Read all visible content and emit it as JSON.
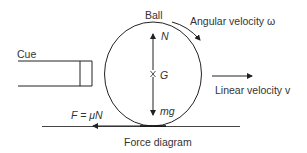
{
  "diagram": {
    "labels": {
      "cue": "Cue",
      "ball": "Ball",
      "angular_velocity": "Angular velocity ω",
      "linear_velocity": "Linear velocity v",
      "normal_force": "N",
      "center_of_gravity": "G",
      "weight": "mg",
      "friction": "F = μN",
      "caption": "Force diagram"
    },
    "colors": {
      "stroke": "#222222",
      "ground": "#444444",
      "text": "#333333"
    }
  }
}
